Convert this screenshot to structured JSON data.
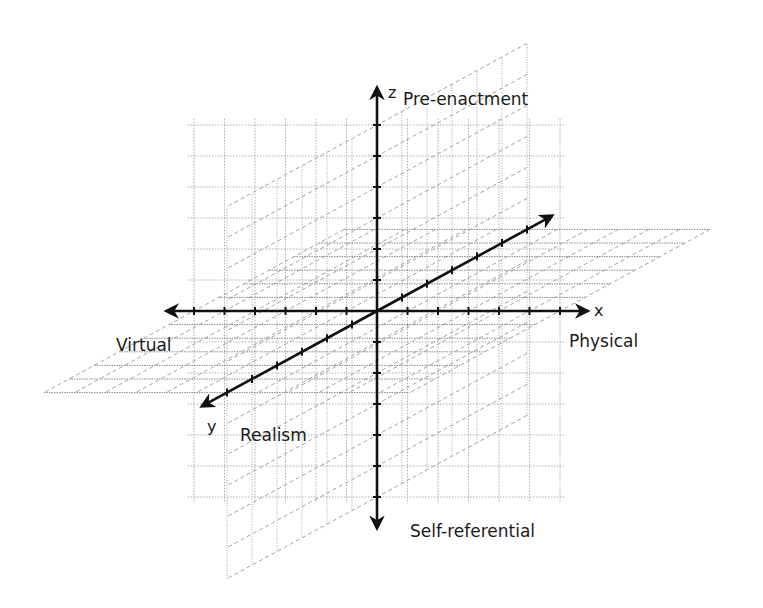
{
  "diagram": {
    "type": "3d-axes",
    "axes": {
      "x": {
        "name": "x",
        "positive_label": "Physical",
        "negative_label": "Virtual"
      },
      "y": {
        "name": "y",
        "positive_label": "Realism"
      },
      "z": {
        "name": "z",
        "positive_label": "Pre-enactment",
        "negative_label": "Self-referential"
      }
    },
    "ticks_per_half_axis": 6,
    "planes": [
      "xy",
      "xz",
      "yz"
    ],
    "colors": {
      "axis": "#111111",
      "grid": "#9a9a9a",
      "label": "#1a1a1a"
    }
  }
}
